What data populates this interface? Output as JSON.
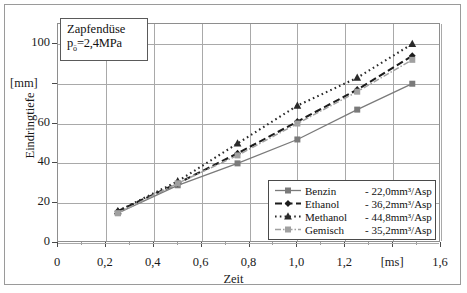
{
  "annotation": {
    "line1": "Zapfendüse",
    "line2_pre": "p",
    "line2_sub": "ö",
    "line2_post": "=2,4MPa"
  },
  "axes": {
    "y_title": "Eindringtiefe",
    "y_unit": "[mm]",
    "y_ticks": [
      "0",
      "20",
      "40",
      "60",
      "[mm]",
      "100"
    ],
    "y_tick_values": [
      0,
      20,
      40,
      60,
      80,
      100
    ],
    "x_title": "Zeit",
    "x_unit": "[ms]",
    "x_ticks": [
      "0",
      "0,2",
      "0,4",
      "0,6",
      "0,8",
      "1,0",
      "1,2",
      "[ms]",
      "1,6"
    ],
    "x_tick_values": [
      0,
      0.2,
      0.4,
      0.6,
      0.8,
      1.0,
      1.2,
      1.4,
      1.6
    ]
  },
  "legend": {
    "entries": [
      {
        "name": "Benzin",
        "value": "- 22,0mm³/Asp",
        "style": "solid-square"
      },
      {
        "name": "Ethanol",
        "value": "- 36,2mm³/Asp",
        "style": "dashed-diamond"
      },
      {
        "name": "Methanol",
        "value": "- 44,8mm³/Asp",
        "style": "dotted-triangle"
      },
      {
        "name": "Gemisch",
        "value": "- 35,2mm³/Asp",
        "style": "dashdot-square"
      }
    ]
  },
  "colors": {
    "benzin": "#7a7a7a",
    "ethanol": "#1c1c1c",
    "methanol": "#2a2a2a",
    "gemisch": "#a0a0a0",
    "grid": "#a9a9a9",
    "frame": "#8e8e8e"
  },
  "chart_data": {
    "type": "line",
    "title": "",
    "xlabel": "Zeit [ms]",
    "ylabel": "Eindringtiefe [mm]",
    "xlim": [
      0,
      1.6
    ],
    "ylim": [
      0,
      110
    ],
    "grid": true,
    "legend_position": "bottom-right",
    "x": [
      0.25,
      0.5,
      0.75,
      1.0,
      1.25,
      1.48
    ],
    "series": [
      {
        "name": "Benzin",
        "label": "Benzin - 22,0mm³/Asp",
        "values": [
          15,
          29,
          40,
          52,
          67,
          80
        ]
      },
      {
        "name": "Ethanol",
        "label": "Ethanol - 36,2mm³/Asp",
        "values": [
          16,
          30,
          45,
          61,
          77,
          94
        ]
      },
      {
        "name": "Methanol",
        "label": "Methanol - 44,8mm³/Asp",
        "values": [
          16,
          31,
          50,
          69,
          83,
          100
        ]
      },
      {
        "name": "Gemisch",
        "label": "Gemisch - 35,2mm³/Asp",
        "values": [
          15,
          30,
          44,
          60,
          76,
          92
        ]
      }
    ]
  }
}
